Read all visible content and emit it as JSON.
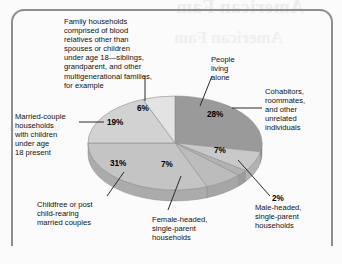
{
  "figure": {
    "type": "pie-chart-figure",
    "background_bleed_text": {
      "title": "American Fam",
      "subtitle": "American Fam",
      "left": "households"
    }
  },
  "chart_data": {
    "type": "pie",
    "title": "",
    "subtitle": "",
    "xlabel": "",
    "ylabel": "",
    "legend_position": "callout-labels",
    "grid": false,
    "three_d": true,
    "start_angle_deg": -90,
    "direction": "clockwise",
    "categories": [
      "People living alone",
      "Cohabitors, roommates, and other unrelated individuals",
      "Male-headed, single-parent households",
      "Female-headed, single-parent households",
      "Childfree or post child-rearing married couples",
      "Married-couple households with children under age 18 present",
      "Family households comprised of blood relatives other than spouses or children under age 18—siblings, grandparent, and other multigenerational families, for example"
    ],
    "values": [
      28,
      7,
      2,
      7,
      31,
      19,
      6
    ],
    "value_labels": [
      "28%",
      "7%",
      "2%",
      "7%",
      "31%",
      "19%",
      "6%"
    ],
    "colors": [
      "#9a9a9a",
      "#c9c9c9",
      "#b2b2b2",
      "#bcbcbc",
      "#c4c4c4",
      "#d2d2d2",
      "#e3e3e3"
    ],
    "side_colors": [
      "#868686",
      "#b2b2b2",
      "#9c9c9c",
      "#a6a6a6",
      "#ababab",
      "#bababa",
      "#cccccc"
    ],
    "slices": [
      {
        "label": "People living alone",
        "value": 28,
        "value_label": "28%",
        "color": "#9a9a9a"
      },
      {
        "label": "Cohabitors, roommates, and other unrelated individuals",
        "value": 7,
        "value_label": "7%",
        "color": "#c9c9c9"
      },
      {
        "label": "Male-headed, single-parent households",
        "value": 2,
        "value_label": "2%",
        "color": "#b2b2b2"
      },
      {
        "label": "Female-headed, single-parent households",
        "value": 7,
        "value_label": "7%",
        "color": "#bcbcbc"
      },
      {
        "label": "Childfree or post child-rearing married couples",
        "value": 31,
        "value_label": "31%",
        "color": "#c4c4c4"
      },
      {
        "label": "Married-couple households with children under age 18 present",
        "value": 19,
        "value_label": "19%",
        "color": "#d2d2d2"
      },
      {
        "label": "Family households comprised of blood relatives other than spouses or children under age 18—siblings, grandparent, and other multigenerational families, for example",
        "value": 6,
        "value_label": "6%",
        "color": "#e3e3e3"
      }
    ]
  },
  "labels": {
    "family": "Family households\ncomprised of blood\nrelatives other than\nspouses or children\nunder age 18—siblings,\ngrandparent, and other\nmultigenerational families,\nfor example",
    "alone": "People\nliving\nalone",
    "cohabitors": "Cohabitors,\nroommates,\nand other\nunrelated\nindividuals",
    "male_headed": "Male-headed,\nsingle-parent\nhouseholds",
    "female_headed": "Female-headed,\nsingle-parent\nhouseholds",
    "childfree": "Childfree or post\nchild-rearing\nmarried couples",
    "married_couple": "Married-couple\nhouseholds\nwith children\nunder age\n18 present"
  },
  "percents": {
    "family": "6%",
    "alone": "28%",
    "cohabitors": "7%",
    "male_headed": "2%",
    "female_headed": "7%",
    "childfree": "31%",
    "married_couple": "19%"
  }
}
